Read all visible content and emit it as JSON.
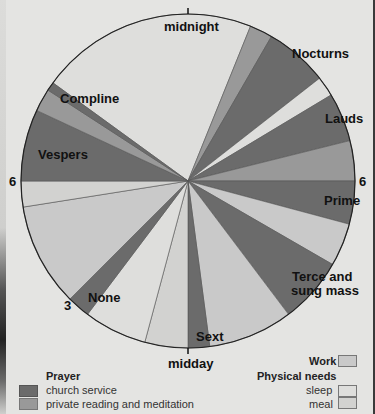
{
  "chart_data": {
    "type": "pie",
    "title": "",
    "subtitle": "",
    "clock": "24-hour, midnight at top, clockwise",
    "tick_labels": {
      "top": "midnight",
      "right": "6",
      "bottom": "midday",
      "left": "6",
      "lower_left": "3"
    },
    "segments": [
      {
        "label": "",
        "category": "sleep",
        "start_deg": 306,
        "end_deg": 382,
        "start_time": "20:24",
        "end_time": "01:28"
      },
      {
        "label": "",
        "category": "private",
        "start_deg": 22,
        "end_deg": 30,
        "start_time": "01:28",
        "end_time": "02:00"
      },
      {
        "label": "Nocturns",
        "category": "church",
        "start_deg": 30,
        "end_deg": 52,
        "start_time": "02:00",
        "end_time": "03:28"
      },
      {
        "label": "",
        "category": "sleep",
        "start_deg": 52,
        "end_deg": 59,
        "start_time": "03:28",
        "end_time": "03:56"
      },
      {
        "label": "Lauds",
        "category": "church",
        "start_deg": 59,
        "end_deg": 76,
        "start_time": "03:56",
        "end_time": "05:04"
      },
      {
        "label": "",
        "category": "private",
        "start_deg": 76,
        "end_deg": 90,
        "start_time": "05:04",
        "end_time": "06:00"
      },
      {
        "label": "Prime",
        "category": "church",
        "start_deg": 90,
        "end_deg": 105,
        "start_time": "06:00",
        "end_time": "07:00"
      },
      {
        "label": "",
        "category": "work",
        "start_deg": 105,
        "end_deg": 120,
        "start_time": "07:00",
        "end_time": "08:00"
      },
      {
        "label": "Terce and sung mass",
        "category": "church",
        "start_deg": 120,
        "end_deg": 143,
        "start_time": "08:00",
        "end_time": "09:32"
      },
      {
        "label": "",
        "category": "work",
        "start_deg": 143,
        "end_deg": 172.5,
        "start_time": "09:32",
        "end_time": "11:30"
      },
      {
        "label": "Sext",
        "category": "church",
        "start_deg": 172.5,
        "end_deg": 180,
        "start_time": "11:30",
        "end_time": "12:00"
      },
      {
        "label": "",
        "category": "meal",
        "start_deg": 180,
        "end_deg": 195,
        "start_time": "12:00",
        "end_time": "13:00"
      },
      {
        "label": "",
        "category": "sleep",
        "start_deg": 195,
        "end_deg": 217,
        "start_time": "13:00",
        "end_time": "14:28"
      },
      {
        "label": "None",
        "category": "church",
        "start_deg": 217,
        "end_deg": 225,
        "start_time": "14:28",
        "end_time": "15:00"
      },
      {
        "label": "",
        "category": "work",
        "start_deg": 225,
        "end_deg": 261,
        "start_time": "15:00",
        "end_time": "17:24"
      },
      {
        "label": "",
        "category": "meal",
        "start_deg": 261,
        "end_deg": 270,
        "start_time": "17:24",
        "end_time": "18:00"
      },
      {
        "label": "Vespers",
        "category": "church",
        "start_deg": 270,
        "end_deg": 295,
        "start_time": "18:00",
        "end_time": "19:40"
      },
      {
        "label": "",
        "category": "private",
        "start_deg": 295,
        "end_deg": 303,
        "start_time": "19:40",
        "end_time": "20:12"
      },
      {
        "label": "Compline",
        "category": "church",
        "start_deg": 303,
        "end_deg": 306,
        "start_time": "20:12",
        "end_time": "20:24"
      }
    ],
    "legend": {
      "position": "bottom",
      "groups": [
        {
          "title": "Prayer",
          "entries": [
            {
              "key": "church",
              "label": "church service"
            },
            {
              "key": "private",
              "label": "private reading and meditation"
            }
          ]
        },
        {
          "title": "Work",
          "entries": [
            {
              "key": "work",
              "label": ""
            }
          ]
        },
        {
          "title": "Physical needs",
          "entries": [
            {
              "key": "sleep",
              "label": "sleep"
            },
            {
              "key": "meal",
              "label": "meal"
            }
          ]
        }
      ]
    },
    "colors": {
      "church": "#6b6b6b",
      "private": "#999999",
      "work": "#c9c9c9",
      "sleep": "#dededc",
      "meal": "#d2d2d0"
    }
  },
  "labels": {
    "midnight": "midnight",
    "midday": "midday",
    "six_right": "6",
    "six_left": "6",
    "three": "3",
    "nocturns": "Nocturns",
    "lauds": "Lauds",
    "prime": "Prime",
    "terce_line1": "Terce and",
    "terce_line2": "sung mass",
    "sext": "Sext",
    "none": "None",
    "vespers": "Vespers",
    "compline": "Compline"
  },
  "legend": {
    "prayer_title": "Prayer",
    "church": "church service",
    "private": "private reading and meditation",
    "work_title": "Work",
    "physical_title": "Physical needs",
    "sleep": "sleep",
    "meal": "meal"
  }
}
